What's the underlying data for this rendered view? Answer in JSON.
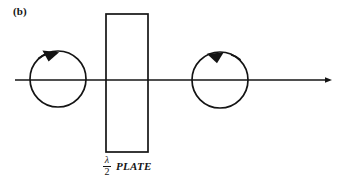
{
  "figure": {
    "panel_label": "(b)",
    "background_color": "#ffffff",
    "stroke_color": "#141414",
    "width": 343,
    "height": 189
  },
  "caption": {
    "fraction_numerator": "λ",
    "fraction_denominator": "2",
    "element_word": "PLATE"
  },
  "diagram_data": {
    "type": "optics-polarization-schematic",
    "description": "Circular polarization handedness reversal through a half-wave plate",
    "axis": {
      "name": "propagation-axis",
      "x_start": 15,
      "x_end": 332,
      "y": 80,
      "arrow_end": "right",
      "stroke_width": 1.4
    },
    "plate": {
      "name": "half-wave-plate",
      "x": 106,
      "y": 14,
      "width": 42,
      "height": 138,
      "fill": "none",
      "stroke_width": 1.6
    },
    "circles": [
      {
        "name": "input-circular-polarization",
        "cx": 58,
        "cy": 79,
        "r": 28,
        "stroke_width": 1.6,
        "handedness": "clockwise",
        "arrow_position": "top-left",
        "arrow_direction": "right"
      },
      {
        "name": "output-circular-polarization",
        "cx": 220,
        "cy": 80,
        "r": 28,
        "stroke_width": 1.6,
        "handedness": "counter-clockwise",
        "arrow_position": "top-right",
        "arrow_direction": "left"
      }
    ]
  }
}
